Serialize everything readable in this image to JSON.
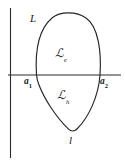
{
  "figure": {
    "type": "mathematical-diagram",
    "background_color": "#ffffff",
    "stroke_color": "#1a1a1a",
    "labels": {
      "contour_upper": "L",
      "contour_lower": "l",
      "region_upper_symbol": "ℒ",
      "region_upper_subscript": "e",
      "region_lower_symbol": "ℒ",
      "region_lower_subscript": "h",
      "point_left_base": "a",
      "point_left_subscript": "1",
      "point_right_base": "a",
      "point_right_subscript": "2"
    },
    "axes": {
      "vertical_axis_x": 10,
      "horizontal_axis_y": 75,
      "horizontal_axis_start_x": 8,
      "horizontal_axis_end_x": 121
    },
    "curve": {
      "top_apex_x": 68,
      "top_apex_y": 13,
      "bottom_cusp_x": 72,
      "bottom_cusp_y": 131,
      "left_crossing_x": 36,
      "right_crossing_x": 100
    }
  }
}
